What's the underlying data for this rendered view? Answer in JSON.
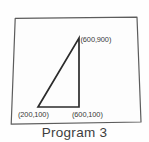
{
  "figure": {
    "caption": "Program 3",
    "frame": {
      "name": "drawing-border",
      "shape": "quadrilateral",
      "stroke_color": "#5c5c5c",
      "fill_color": "#fdfdfd",
      "corners": [
        {
          "x": 15,
          "y": 18
        },
        {
          "x": 137,
          "y": 17
        },
        {
          "x": 141,
          "y": 122
        },
        {
          "x": 11,
          "y": 124
        }
      ]
    },
    "shape": {
      "name": "right-triangle",
      "type": "triangle",
      "stroke_color": "#2b2b2b",
      "vertices": [
        {
          "label": "(200,100)",
          "x": 200,
          "y": 100,
          "px": 38,
          "py": 107
        },
        {
          "label": "(600,900)",
          "x": 600,
          "y": 900,
          "px": 79,
          "py": 38
        },
        {
          "label": "(600,100)",
          "x": 600,
          "y": 100,
          "px": 79,
          "py": 107
        }
      ],
      "labels": {
        "apex": "(600,900)",
        "bottom_left": "(200,100)",
        "bottom_right": "(600,100)"
      }
    }
  }
}
